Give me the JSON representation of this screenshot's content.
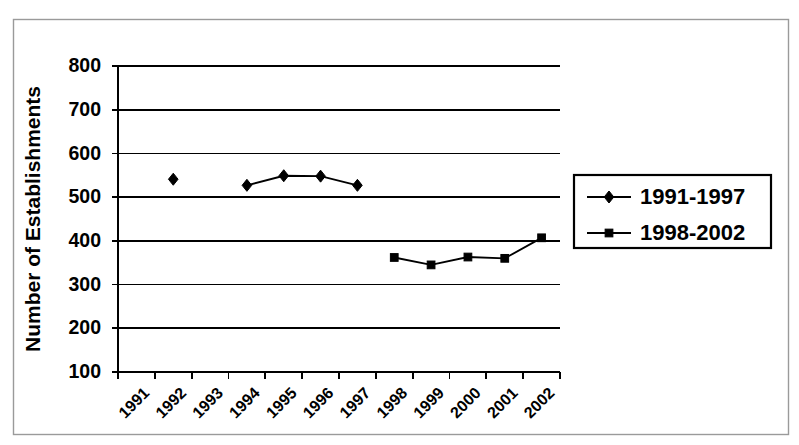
{
  "chart_data": {
    "type": "line",
    "title": "",
    "xlabel": "",
    "ylabel": "Number of Establishments",
    "categories": [
      "1991",
      "1992",
      "1993",
      "1994",
      "1995",
      "1996",
      "1997",
      "1998",
      "1999",
      "2000",
      "2001",
      "2002"
    ],
    "ylim": [
      100,
      800
    ],
    "ytick_values": [
      100,
      200,
      300,
      400,
      500,
      600,
      700,
      800
    ],
    "ytick_labels": [
      "100",
      "200",
      "300",
      "400",
      "500",
      "600",
      "700",
      "800"
    ],
    "grid": "horizontal",
    "legend_position": "right",
    "series": [
      {
        "name": "1991-1997",
        "marker": "diamond",
        "values": [
          null,
          541,
          null,
          527,
          549,
          548,
          527,
          null,
          null,
          null,
          null,
          null
        ]
      },
      {
        "name": "1998-2002",
        "marker": "square",
        "values": [
          null,
          null,
          null,
          null,
          null,
          null,
          null,
          362,
          345,
          363,
          360,
          407
        ]
      }
    ]
  },
  "legend": {
    "items": [
      {
        "label": "1991-1997",
        "marker": "diamond"
      },
      {
        "label": "1998-2002",
        "marker": "square"
      }
    ]
  }
}
